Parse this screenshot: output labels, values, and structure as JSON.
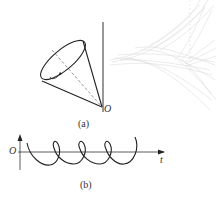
{
  "figure_a": {
    "caption": "(a)",
    "origin_label": "O",
    "description": "Tilted cone precessing about a vertical axis with apex at O"
  },
  "figure_b": {
    "caption": "(b)",
    "origin_label": "O",
    "axis_label": "t",
    "description": "Looping trajectory (cycloid-like curve with loops) along the t axis"
  },
  "colors": {
    "line": "#333333",
    "surface": "#c8c8c8"
  }
}
